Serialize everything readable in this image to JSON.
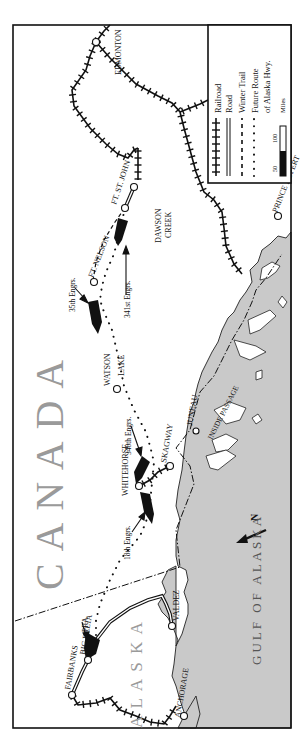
{
  "map": {
    "orientation": "rotated 90° counter-clockwise",
    "region_labels": {
      "canada": "C A N A D A",
      "alaska": "A L A S K A",
      "gulf": "GULF OF ALASKA",
      "inside_passage": "INSIDE PASSAGE"
    },
    "places": [
      {
        "id": "edmonton",
        "label": "EDMONTON"
      },
      {
        "id": "ft_st_john",
        "label": "FT. ST. JOHN"
      },
      {
        "id": "dawson_creek",
        "label": "DAWSON CREEK",
        "line1": "DAWSON",
        "line2": "CREEK"
      },
      {
        "id": "ft_nelson",
        "label": "FT. NELSON"
      },
      {
        "id": "watson_lake",
        "label": "WATSON LAKE",
        "line1": "WATSON",
        "line2": "LAKE"
      },
      {
        "id": "whitehorse",
        "label": "WHITEHORSE"
      },
      {
        "id": "skagway",
        "label": "SKAGWAY"
      },
      {
        "id": "juneau",
        "label": "JUNEAU"
      },
      {
        "id": "prince_rupert",
        "label": "PRINCE RUPERT"
      },
      {
        "id": "fairbanks",
        "label": "FAIRBANKS"
      },
      {
        "id": "big_delta",
        "label": "BIG DELTA"
      },
      {
        "id": "anchorage",
        "label": "ANCHORAGE"
      },
      {
        "id": "valdez",
        "label": "VALDEZ"
      }
    ],
    "units": [
      {
        "id": "35th",
        "label": "35th Engrs."
      },
      {
        "id": "341st",
        "label": "341st Engrs."
      },
      {
        "id": "340th",
        "label": "340th Engrs."
      },
      {
        "id": "18th",
        "label": "18th Engrs."
      },
      {
        "id": "pra",
        "label": "PRA"
      }
    ],
    "north_arrow": {
      "label": "N"
    }
  },
  "legend": {
    "items": [
      {
        "symbol": "railroad",
        "label": "Railroad"
      },
      {
        "symbol": "road",
        "label": "Road"
      },
      {
        "symbol": "winter-trail",
        "label": "Winter Trail"
      },
      {
        "symbol": "future-route",
        "label": "Future Route",
        "label2": "of Alaska Hwy."
      }
    ],
    "scale": {
      "tick1": "50",
      "tick2": "100",
      "unit": "Miles"
    }
  }
}
